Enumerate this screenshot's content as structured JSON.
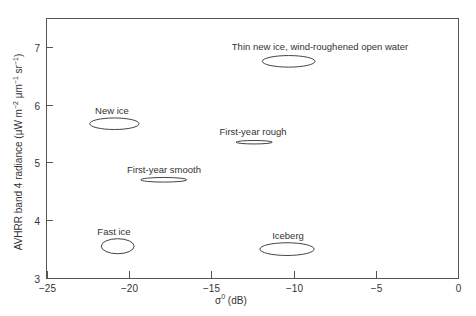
{
  "chart_data": {
    "type": "scatter",
    "title": "",
    "xlabel": "σ0 (dB)",
    "xlabel_base": "σ",
    "xlabel_sup": "0",
    "xlabel_unit": " (dB)",
    "ylabel": "AVHRR band 4 radiance (μW m−2 μm−1 sr−1)",
    "ylabel_parts": {
      "main": "AVHRR band 4 radiance (μW m",
      "sup1": "−2",
      "mid": " μm",
      "sup2": "−1",
      "end": " sr",
      "sup3": "−1",
      "close": ")"
    },
    "xlim": [
      -25,
      0
    ],
    "ylim": [
      3,
      7.5
    ],
    "xticks": [
      -25,
      -20,
      -15,
      -10,
      -5,
      0
    ],
    "xtick_labels": [
      "−25",
      "−20",
      "−15",
      "−10",
      "−5",
      "0"
    ],
    "yticks": [
      3,
      4,
      5,
      6,
      7
    ],
    "ytick_labels": [
      "3",
      "4",
      "5",
      "6",
      "7"
    ],
    "grid": false,
    "legend": null,
    "series": [
      {
        "name": "Thin new ice, wind-roughened open water",
        "x": -10.3,
        "y": 6.75,
        "x_halfwidth": 1.6,
        "y_halfheight": 0.1
      },
      {
        "name": "New ice",
        "x": -20.9,
        "y": 5.67,
        "x_halfwidth": 1.5,
        "y_halfheight": 0.1
      },
      {
        "name": "First-year rough",
        "x": -12.4,
        "y": 5.35,
        "x_halfwidth": 1.1,
        "y_halfheight": 0.03
      },
      {
        "name": "First-year smooth",
        "x": -17.9,
        "y": 4.7,
        "x_halfwidth": 1.4,
        "y_halfheight": 0.04
      },
      {
        "name": "Fast ice",
        "x": -20.7,
        "y": 3.55,
        "x_halfwidth": 1.0,
        "y_halfheight": 0.13
      },
      {
        "name": "Iceberg",
        "x": -10.4,
        "y": 3.5,
        "x_halfwidth": 1.65,
        "y_halfheight": 0.11
      }
    ]
  },
  "annotations": [
    {
      "text": "Thin new ice, wind-roughened open water",
      "label_x": 320,
      "label_y": 50,
      "anchor": "middle"
    },
    {
      "text": "New ice",
      "label_x": 112,
      "label_y": 114,
      "anchor": "middle"
    },
    {
      "text": "First-year rough",
      "label_x": 253,
      "label_y": 135,
      "anchor": "middle"
    },
    {
      "text": "First-year smooth",
      "label_x": 164,
      "label_y": 173,
      "anchor": "middle"
    },
    {
      "text": "Fast ice",
      "label_x": 114,
      "label_y": 235,
      "anchor": "middle"
    },
    {
      "text": "Iceberg",
      "label_x": 288,
      "label_y": 239,
      "anchor": "middle"
    }
  ]
}
